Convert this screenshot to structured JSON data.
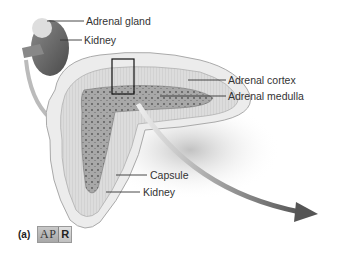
{
  "figure": {
    "panel_label": "(a)",
    "badge": {
      "left": "AP",
      "right": "R"
    },
    "labels": {
      "adrenal_gland": "Adrenal gland",
      "kidney_top": "Kidney",
      "adrenal_cortex": "Adrenal cortex",
      "adrenal_medulla": "Adrenal medulla",
      "capsule": "Capsule",
      "kidney_bottom": "Kidney"
    }
  },
  "colors": {
    "line": "#333333",
    "tissue": "#d8d8d8",
    "medulla": "#9a9a9a",
    "arrow": "#555555"
  }
}
